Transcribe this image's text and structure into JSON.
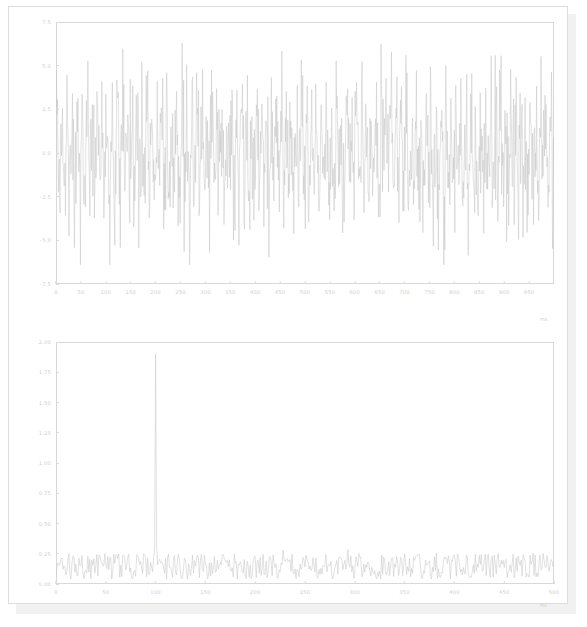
{
  "window": {
    "title": ""
  },
  "chart_data": [
    {
      "id": "time_series",
      "type": "line",
      "title": "",
      "xlabel": "ms",
      "ylabel": "",
      "xlim": [
        0,
        1000
      ],
      "ylim": [
        -7.5,
        7.5
      ],
      "grid": false,
      "legend": null,
      "line_color": "#c8c8c8",
      "xticks": [
        "0",
        "50",
        "100",
        "150",
        "200",
        "250",
        "300",
        "350",
        "400",
        "450",
        "500",
        "550",
        "600",
        "650",
        "700",
        "750",
        "800",
        "850",
        "900",
        "950"
      ],
      "xtick_values": [
        0,
        50,
        100,
        150,
        200,
        250,
        300,
        350,
        400,
        450,
        500,
        550,
        600,
        650,
        700,
        750,
        800,
        850,
        900,
        950
      ],
      "yticks": [
        "7.5",
        "5.0",
        "2.5",
        "0.0",
        "-2.5",
        "-5.0",
        "-7.5"
      ],
      "ytick_values": [
        7.5,
        5.0,
        2.5,
        0.0,
        -2.5,
        -5.0,
        -7.5
      ],
      "series": [
        {
          "name": "signal",
          "description": "Gaussian white noise plus 100 Hz sinusoid, 1000 samples over 1000 ms",
          "sample_count": 1000,
          "noise_std": 2.0,
          "sine_amplitude": 1.9,
          "sine_frequency_hz": 100,
          "observed_min": -6.4,
          "observed_max": 6.3
        }
      ]
    },
    {
      "id": "spectrum",
      "type": "line",
      "title": "",
      "xlabel": "Hz",
      "ylabel": "",
      "xlim": [
        0,
        500
      ],
      "ylim": [
        0.0,
        2.0
      ],
      "grid": false,
      "legend": null,
      "line_color": "#c8c8c8",
      "xticks": [
        "0",
        "50",
        "100",
        "150",
        "200",
        "250",
        "300",
        "350",
        "400",
        "450",
        "500"
      ],
      "xtick_values": [
        0,
        50,
        100,
        150,
        200,
        250,
        300,
        350,
        400,
        450,
        500
      ],
      "yticks": [
        "2.00",
        "1.75",
        "1.50",
        "1.25",
        "1.00",
        "0.75",
        "0.50",
        "0.25",
        "0.00"
      ],
      "ytick_values": [
        2.0,
        1.75,
        1.5,
        1.25,
        1.0,
        0.75,
        0.5,
        0.25,
        0.0
      ],
      "series": [
        {
          "name": "magnitude_spectrum",
          "description": "Single-sided amplitude spectrum of the time series",
          "noise_floor_mean": 0.16,
          "noise_floor_max": 0.33,
          "peaks": [
            {
              "frequency_hz": 100,
              "amplitude": 1.9,
              "label": "primary"
            },
            {
              "frequency_hz": 293,
              "amplitude": 0.45,
              "label": "secondary"
            },
            {
              "frequency_hz": 228,
              "amplitude": 0.36,
              "label": "minor"
            }
          ]
        }
      ]
    }
  ]
}
